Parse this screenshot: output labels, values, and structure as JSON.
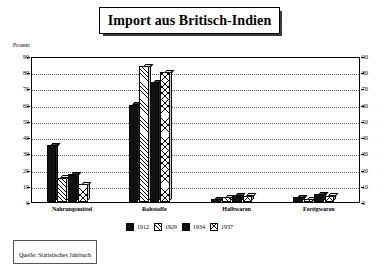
{
  "title": "Import aus Britisch-Indien",
  "source": "Quelle: Statistisches Jahrbuch",
  "chart_data": {
    "type": "bar",
    "title": "Import aus Britisch-Indien",
    "xlabel": "",
    "ylabel": "Prozent",
    "ylim": [
      0,
      90
    ],
    "yticks": [
      0,
      10,
      20,
      30,
      40,
      50,
      60,
      70,
      80,
      90
    ],
    "grid": true,
    "legend_position": "bottom",
    "dual_axis": true,
    "categories": [
      "Nahrungsmittel",
      "Rohstoffe",
      "Halbwaren",
      "Fertigwaren"
    ],
    "series": [
      {
        "name": "1912",
        "pattern": "solid-black",
        "values": [
          35,
          60,
          2,
          3
        ]
      },
      {
        "name": "1929",
        "pattern": "diagonal-hatch",
        "values": [
          15,
          84,
          3,
          2
        ]
      },
      {
        "name": "1934",
        "pattern": "solid-black",
        "values": [
          17,
          74,
          4,
          5
        ]
      },
      {
        "name": "1937",
        "pattern": "cross-hatch",
        "values": [
          11,
          80,
          4,
          4
        ]
      }
    ]
  }
}
